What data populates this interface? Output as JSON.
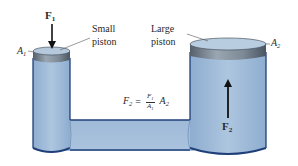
{
  "figure": {
    "colors": {
      "fluid": "#a9c3dd",
      "fluid_dark": "#7f9fc4",
      "outline": "#1f3f78",
      "piston_top": "#b9cde0",
      "piston_side": "#7b8a9a",
      "arrow": "#111111",
      "text": "#2a2a2a",
      "background": "#ffffff"
    },
    "labels": {
      "force_in": {
        "symbol": "F",
        "subscript": "1"
      },
      "force_out": {
        "symbol": "F",
        "subscript": "2"
      },
      "area_small": {
        "symbol": "A",
        "subscript": "1"
      },
      "area_large": {
        "symbol": "A",
        "subscript": "2"
      },
      "small_piston_line1": "Small",
      "small_piston_line2": "piston",
      "large_piston_line1": "Large",
      "large_piston_line2": "piston"
    },
    "equation": {
      "lhs_symbol": "F",
      "lhs_sub": "2",
      "equals": "=",
      "num_symbol": "F",
      "num_sub": "1",
      "den_symbol": "A",
      "den_sub": "1",
      "rhs_symbol": "A",
      "rhs_sub": "2"
    }
  }
}
